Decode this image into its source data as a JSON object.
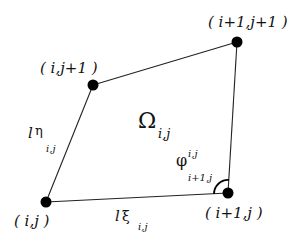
{
  "diagram": {
    "nodes": [
      {
        "id": "n_ij",
        "label": "( i,j )",
        "x": 46,
        "y": 202
      },
      {
        "id": "n_i1j",
        "label": "( i+1,j )",
        "x": 228,
        "y": 193
      },
      {
        "id": "n_i1j1",
        "label": "( i+1,j+1 )",
        "x": 237,
        "y": 42
      },
      {
        "id": "n_ij1",
        "label": "( i,j+1 )",
        "x": 93,
        "y": 85
      }
    ],
    "edges": [
      {
        "from": "n_ij",
        "to": "n_i1j",
        "label_main": "l",
        "label_sym": "ξ",
        "label_sub": "i,j"
      },
      {
        "from": "n_i1j",
        "to": "n_i1j1",
        "label_main": "",
        "label_sym": "",
        "label_sub": ""
      },
      {
        "from": "n_i1j1",
        "to": "n_ij1",
        "label_main": "",
        "label_sym": "",
        "label_sub": ""
      },
      {
        "from": "n_ij1",
        "to": "n_ij",
        "label_main": "l",
        "label_sym": "η",
        "label_sub": "i,j"
      }
    ],
    "cell_label": {
      "symbol": "Ω",
      "sub": "i,j"
    },
    "angle_label": {
      "symbol": "φ",
      "sup": "i,j",
      "sub": "i+1,j"
    },
    "colors": {
      "node": "#000000",
      "edge": "#222222",
      "text": "#111111",
      "background": "#ffffff"
    }
  }
}
